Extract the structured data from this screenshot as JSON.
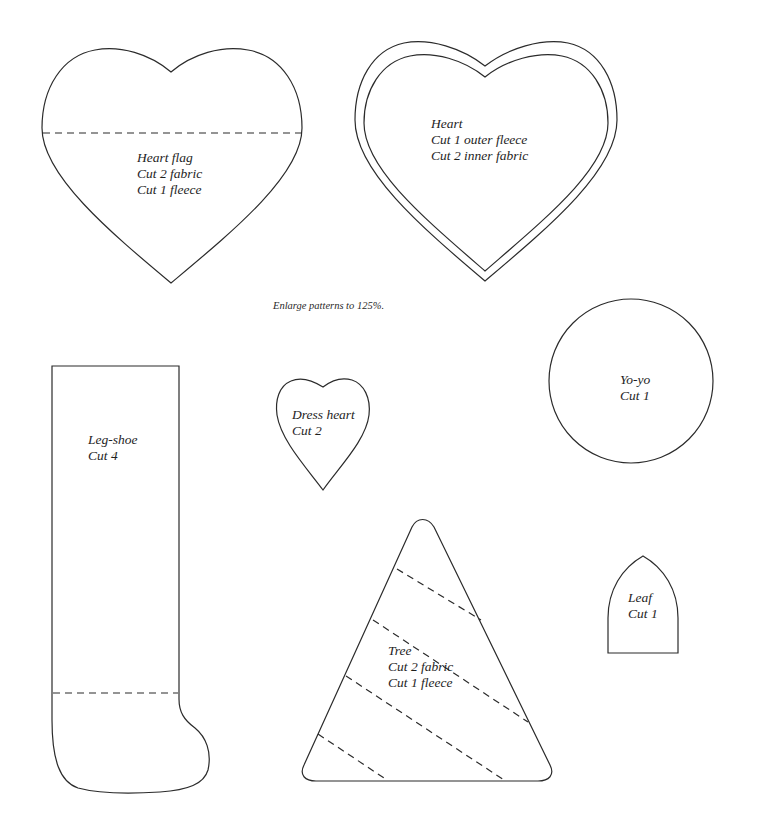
{
  "note": "Enlarge patterns to 125%.",
  "colors": {
    "line": "#2b2b2b",
    "background": "#ffffff",
    "text": "#1e1e1e"
  },
  "patterns": {
    "heart_flag": {
      "lines": [
        "Heart flag",
        "Cut 2 fabric",
        "Cut 1 fleece"
      ]
    },
    "heart": {
      "lines": [
        "Heart",
        "Cut 1 outer fleece",
        "Cut 2 inner fabric"
      ]
    },
    "yo_yo": {
      "lines": [
        "Yo-yo",
        "Cut 1"
      ]
    },
    "leg_shoe": {
      "lines": [
        "Leg-shoe",
        "Cut 4"
      ]
    },
    "dress_heart": {
      "lines": [
        "Dress heart",
        "Cut 2"
      ]
    },
    "tree": {
      "lines": [
        "Tree",
        "Cut 2 fabric",
        "Cut 1 fleece"
      ]
    },
    "leaf": {
      "lines": [
        "Leaf",
        "Cut 1"
      ]
    }
  }
}
